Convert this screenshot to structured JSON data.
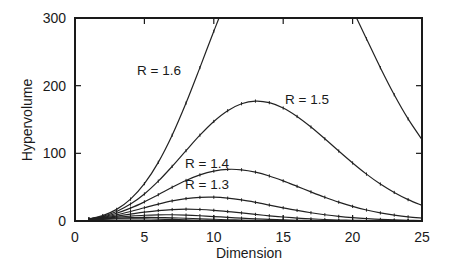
{
  "chart_data": {
    "type": "line",
    "title": "",
    "xlabel": "Dimension",
    "ylabel": "Hypervolume",
    "xlim": [
      0,
      25
    ],
    "ylim": [
      0,
      300
    ],
    "x_ticks": [
      0,
      5,
      10,
      15,
      20,
      25
    ],
    "y_ticks": [
      0,
      100,
      200,
      300
    ],
    "grid": false,
    "legend": "inline labels on curves",
    "x": [
      1,
      2,
      3,
      4,
      5,
      6,
      7,
      8,
      9,
      10,
      11,
      12,
      13,
      14,
      15,
      16,
      17,
      18,
      19,
      20,
      21,
      22,
      23,
      24,
      25
    ],
    "series": [
      {
        "name": "R = 1.6",
        "label": "R = 1.6",
        "labeled": true,
        "values": [
          3.2,
          8.04,
          17.16,
          32.34,
          55.2,
          86.7,
          126.8,
          174.3,
          226.7,
          280.4,
          331.4,
          375.9,
          410.1,
          431.9,
          439.8,
          434.1,
          416.1,
          388.1,
          352.1,
          312.0,
          269.2,
          226.6,
          186.6,
          150.9,
          120.4
        ]
      },
      {
        "name": "R = 1.5",
        "label": "R = 1.5",
        "labeled": true,
        "values": [
          3.0,
          7.07,
          14.14,
          24.98,
          39.97,
          58.86,
          80.73,
          104.0,
          126.8,
          147.1,
          163.0,
          173.3,
          177.2,
          174.9,
          167.0,
          154.5,
          138.9,
          121.5,
          103.4,
          85.8,
          69.3,
          54.6,
          42.2,
          31.6,
          23.2
        ]
      },
      {
        "name": "R = 1.4",
        "label": "R = 1.4",
        "labeled": true,
        "values": [
          2.8,
          6.16,
          11.49,
          18.96,
          28.31,
          38.91,
          49.81,
          59.9,
          68.15,
          73.78,
          76.31,
          75.7,
          72.27,
          66.58,
          59.34,
          51.25,
          42.99,
          35.09,
          27.85,
          21.59,
          16.28,
          11.97,
          8.73,
          6.11,
          4.28
        ]
      },
      {
        "name": "R = 1.3",
        "label": "R = 1.3",
        "labeled": true,
        "values": [
          2.6,
          5.31,
          9.2,
          14.09,
          19.54,
          24.94,
          29.65,
          33.11,
          34.97,
          35.17,
          33.76,
          31.11,
          27.58,
          23.59,
          19.52,
          15.66,
          12.2,
          9.25,
          6.81,
          4.9,
          3.43,
          2.34,
          1.59,
          1.03,
          0.67
        ]
      },
      {
        "name": "R = 1.2",
        "label": "",
        "labeled": false,
        "values": [
          2.4,
          4.52,
          7.24,
          10.23,
          13.1,
          15.43,
          16.93,
          17.45,
          17.02,
          15.79,
          14.0,
          11.91,
          9.74,
          7.7,
          5.88,
          4.35,
          3.13,
          2.19,
          1.49,
          0.99,
          0.64,
          0.4,
          0.25,
          0.15,
          0.09
        ]
      },
      {
        "name": "R = 1.1",
        "label": "",
        "labeled": false,
        "values": [
          2.2,
          3.8,
          5.58,
          7.22,
          8.48,
          9.16,
          9.21,
          8.7,
          7.78,
          6.61,
          5.38,
          4.19,
          3.14,
          2.28,
          1.59,
          1.08,
          0.71,
          0.46,
          0.29,
          0.17,
          0.1,
          0.06,
          0.03,
          0.02,
          0.01
        ]
      },
      {
        "name": "R = 1.0",
        "label": "",
        "labeled": false,
        "values": [
          2.0,
          3.14,
          4.19,
          4.93,
          5.26,
          5.17,
          4.72,
          4.06,
          3.3,
          2.55,
          1.88,
          1.34,
          0.91,
          0.6,
          0.38,
          0.24,
          0.14,
          0.08,
          0.05,
          0.03,
          0.01,
          0.01,
          0.0,
          0.0,
          0.0
        ]
      },
      {
        "name": "R = 0.9",
        "label": "",
        "labeled": false,
        "values": [
          1.8,
          2.54,
          3.05,
          3.24,
          3.11,
          2.75,
          2.26,
          1.75,
          1.28,
          0.89,
          0.59,
          0.38,
          0.23,
          0.14,
          0.08,
          0.04,
          0.02,
          0.01,
          0.01,
          0.0,
          0.0,
          0.0,
          0.0,
          0.0,
          0.0
        ]
      }
    ],
    "annotations": [
      {
        "text": "R = 1.6",
        "x": 4.9,
        "y": 245
      },
      {
        "text": "R = 1.5",
        "x": 15.1,
        "y": 178
      },
      {
        "text": "R = 1.4",
        "x": 8.3,
        "y": 80
      },
      {
        "text": "R = 1.3",
        "x": 8.3,
        "y": 49
      }
    ]
  },
  "axes": {
    "x_tick_labels": [
      "0",
      "5",
      "10",
      "15",
      "20",
      "25"
    ],
    "y_tick_labels": [
      "0",
      "100",
      "200",
      "300"
    ],
    "xlabel": "Dimension",
    "ylabel": "Hypervolume"
  },
  "labels": {
    "r16": "R = 1.6",
    "r15": "R = 1.5",
    "r14": "R = 1.4",
    "r13": "R = 1.3"
  }
}
